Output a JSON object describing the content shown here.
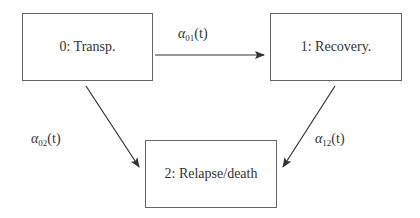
{
  "diagram": {
    "type": "multi-state model",
    "states": [
      {
        "id": "0",
        "label": "0: Transp."
      },
      {
        "id": "1",
        "label": "1: Recovery."
      },
      {
        "id": "2",
        "label": "2: Relapse/death"
      }
    ],
    "transitions": [
      {
        "from": "0",
        "to": "1",
        "symbol": "α",
        "sub": "01",
        "arg": "(t)"
      },
      {
        "from": "0",
        "to": "2",
        "symbol": "α",
        "sub": "02",
        "arg": "(t)"
      },
      {
        "from": "1",
        "to": "2",
        "symbol": "α",
        "sub": "12",
        "arg": "(t)"
      }
    ]
  }
}
